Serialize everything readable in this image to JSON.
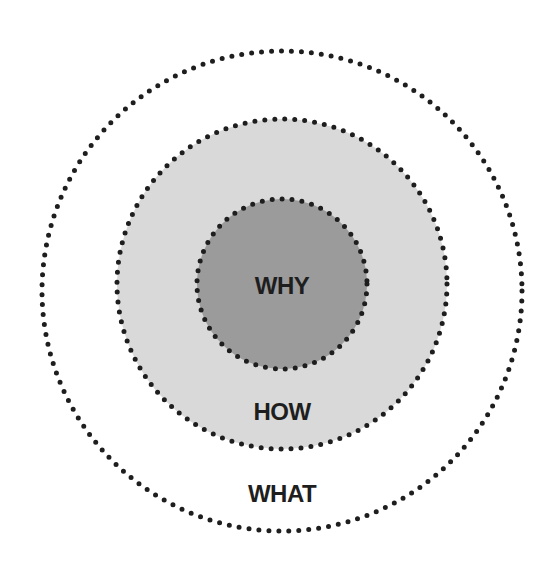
{
  "diagram": {
    "type": "golden-circle",
    "circles": [
      {
        "id": "what",
        "label": "WHAT",
        "fill": "#ffffff",
        "cx": 282,
        "cy": 291,
        "r": 240
      },
      {
        "id": "how",
        "label": "HOW",
        "fill": "#d9d9d9",
        "cx": 282,
        "cy": 284,
        "r": 165
      },
      {
        "id": "why",
        "label": "WHY",
        "fill": "#9b9b9b",
        "cx": 282,
        "cy": 284,
        "r": 85
      }
    ],
    "border_color": "#1e1e1e",
    "border_style": "dotted"
  }
}
